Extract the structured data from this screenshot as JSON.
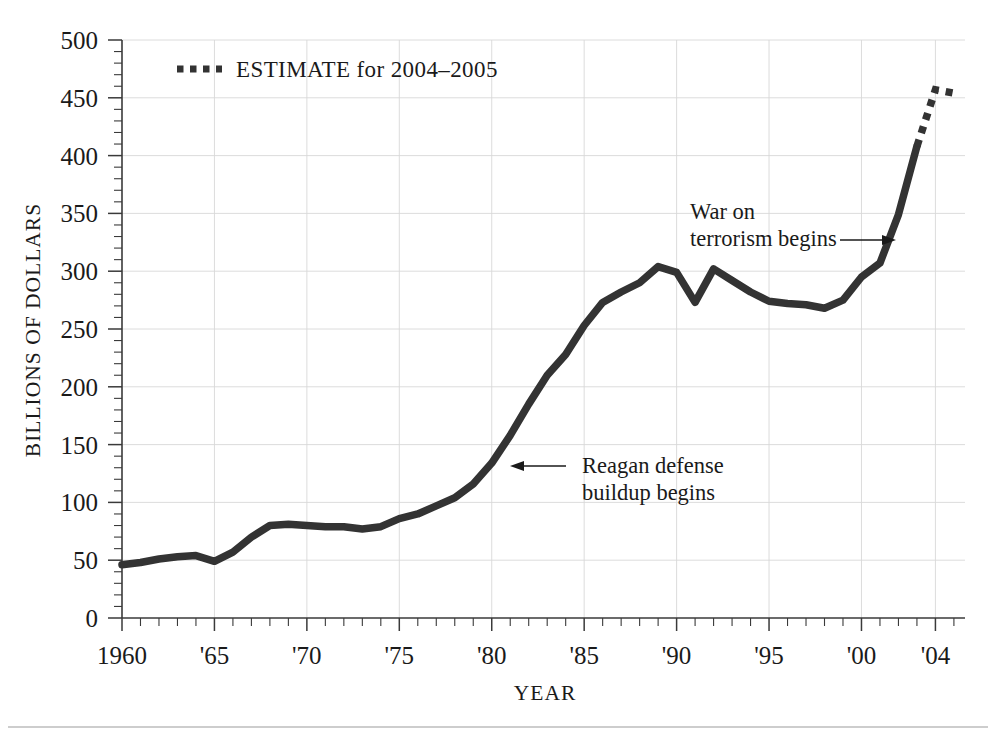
{
  "chart_data": {
    "type": "line",
    "title": "",
    "xlabel": "YEAR",
    "ylabel": "BILLIONS OF DOLLARS",
    "xlim": [
      1960,
      2005.6
    ],
    "ylim": [
      0,
      500
    ],
    "grid": true,
    "y_ticks": [
      0,
      50,
      100,
      150,
      200,
      250,
      300,
      350,
      400,
      450,
      500
    ],
    "y_tick_labels": [
      "0",
      "50",
      "100",
      "150",
      "200",
      "250",
      "300",
      "350",
      "400",
      "450",
      "500"
    ],
    "y_minor_step": 10,
    "x_ticks": [
      1960,
      1965,
      1970,
      1975,
      1980,
      1985,
      1990,
      1995,
      2000,
      2004
    ],
    "x_tick_labels": [
      "1960",
      "'65",
      "'70",
      "'75",
      "'80",
      "'85",
      "'90",
      "'95",
      "'00",
      "'04"
    ],
    "x_minor_step": 1,
    "legend_position": "top-left-inside",
    "legend": [
      {
        "label": "ESTIMATE for 2004–2005",
        "style": "dotted",
        "color": "#333333"
      }
    ],
    "series": [
      {
        "name": "Defense spending (actual)",
        "style": "solid",
        "color": "#333333",
        "x": [
          1960,
          1961,
          1962,
          1963,
          1964,
          1965,
          1966,
          1967,
          1968,
          1969,
          1970,
          1971,
          1972,
          1973,
          1974,
          1975,
          1976,
          1977,
          1978,
          1979,
          1980,
          1981,
          1982,
          1983,
          1984,
          1985,
          1986,
          1987,
          1988,
          1989,
          1990,
          1991,
          1992,
          1993,
          1994,
          1995,
          1996,
          1997,
          1998,
          1999,
          2000,
          2001,
          2002,
          2003
        ],
        "y": [
          46,
          48,
          51,
          53,
          54,
          49,
          57,
          70,
          80,
          81,
          80,
          79,
          79,
          77,
          79,
          86,
          90,
          97,
          104,
          116,
          134,
          158,
          185,
          210,
          228,
          253,
          273,
          282,
          290,
          304,
          299,
          273,
          302,
          292,
          282,
          274,
          272,
          271,
          268,
          275,
          295,
          307,
          349,
          408
        ],
        "annotations": [
          {
            "label": "Reagan defense buildup begins",
            "x": 1980,
            "y": 134
          },
          {
            "label": "War on terrorism begins",
            "x": 2002,
            "y": 349
          }
        ]
      },
      {
        "name": "Defense spending (estimate)",
        "style": "dotted",
        "color": "#333333",
        "x": [
          2003,
          2004,
          2005
        ],
        "y": [
          408,
          457,
          454
        ]
      }
    ]
  },
  "annotations": {
    "reagan": {
      "line1": "Reagan defense",
      "line2": "buildup begins"
    },
    "terror": {
      "line1": "War on",
      "line2": "terrorism begins"
    }
  },
  "legend": {
    "estimate_label": "ESTIMATE for 2004–2005"
  },
  "axes": {
    "y_title": "BILLIONS OF DOLLARS",
    "x_title": "YEAR",
    "y_labels": [
      "500",
      "450",
      "400",
      "350",
      "300",
      "250",
      "200",
      "150",
      "100",
      "50",
      "0"
    ],
    "x_labels": [
      "1960",
      "'65",
      "'70",
      "'75",
      "'80",
      "'85",
      "'90",
      "'95",
      "'00",
      "'04"
    ]
  },
  "colors": {
    "line": "#333333",
    "grid": "#d8d8d8",
    "axis": "#3a3a3a",
    "text": "#1a1a1a",
    "background": "#ffffff"
  }
}
